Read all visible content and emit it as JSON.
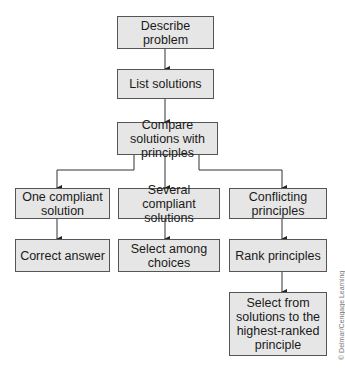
{
  "diagram": {
    "nodes": [
      {
        "id": "describe",
        "label": "Describe problem"
      },
      {
        "id": "list",
        "label": "List solutions"
      },
      {
        "id": "compare",
        "label": "Compare solutions with principles"
      },
      {
        "id": "one",
        "label": "One compliant solution"
      },
      {
        "id": "several",
        "label": "Several compliant solutions"
      },
      {
        "id": "conflicting",
        "label": "Conflicting principles"
      },
      {
        "id": "correct",
        "label": "Correct answer"
      },
      {
        "id": "select_among",
        "label": "Select among choices"
      },
      {
        "id": "rank",
        "label": "Rank principles"
      },
      {
        "id": "select_from",
        "label": "Select from solutions to the highest-ranked principle"
      }
    ],
    "edges": [
      [
        "describe",
        "list"
      ],
      [
        "list",
        "compare"
      ],
      [
        "compare",
        "one"
      ],
      [
        "compare",
        "several"
      ],
      [
        "compare",
        "conflicting"
      ],
      [
        "one",
        "correct"
      ],
      [
        "several",
        "select_among"
      ],
      [
        "conflicting",
        "rank"
      ],
      [
        "rank",
        "select_from"
      ]
    ],
    "credit": "© Delmar/Cengage Learning"
  }
}
